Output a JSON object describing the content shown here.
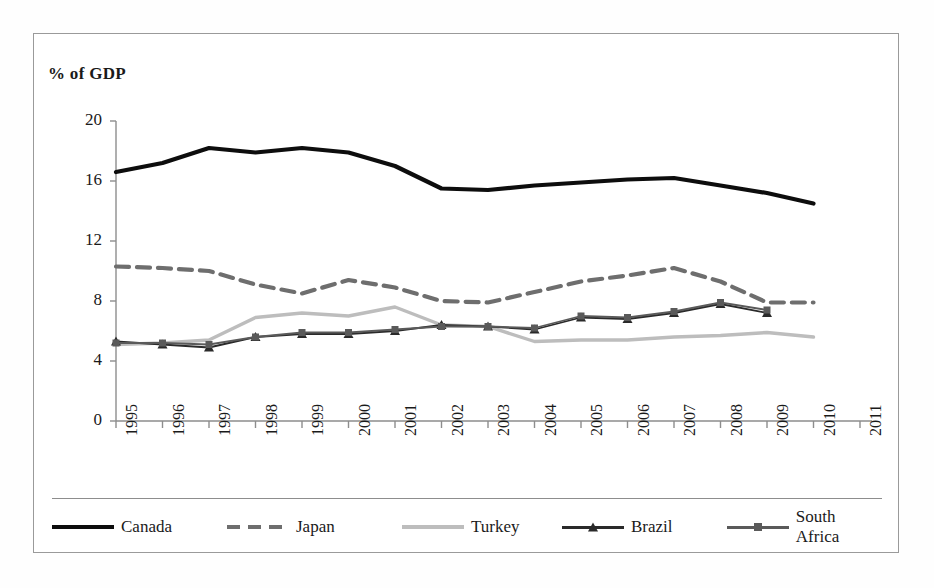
{
  "chart_data": {
    "type": "line",
    "title": "% of GDP",
    "xlabel": "",
    "ylabel": "% of GDP",
    "ylim": [
      0,
      20
    ],
    "yticks": [
      0,
      4,
      8,
      12,
      16,
      20
    ],
    "grid": false,
    "legend_position": "bottom",
    "categories": [
      "1995",
      "1996",
      "1997",
      "1998",
      "1999",
      "2000",
      "2001",
      "2002",
      "2003",
      "2004",
      "2005",
      "2006",
      "2007",
      "2008",
      "2009",
      "2010",
      "2011"
    ],
    "series": [
      {
        "name": "Canada",
        "style": "solid",
        "color": "#0d0d0d",
        "width": 4.2,
        "marker": "none",
        "values": [
          16.6,
          17.2,
          18.2,
          17.9,
          18.2,
          17.9,
          17.0,
          15.5,
          15.4,
          15.7,
          15.9,
          16.1,
          16.2,
          15.7,
          15.2,
          14.5,
          null
        ]
      },
      {
        "name": "Japan",
        "style": "dashed",
        "color": "#6e6e6e",
        "width": 4.2,
        "marker": "none",
        "values": [
          10.3,
          10.2,
          10.0,
          9.1,
          8.5,
          9.4,
          8.9,
          8.0,
          7.9,
          8.6,
          9.3,
          9.7,
          10.2,
          9.3,
          7.9,
          7.9,
          null
        ]
      },
      {
        "name": "Turkey",
        "style": "solid",
        "color": "#bdbdbd",
        "width": 3.4,
        "marker": "none",
        "values": [
          5.1,
          5.2,
          5.4,
          6.9,
          7.2,
          7.0,
          7.6,
          6.4,
          6.3,
          5.3,
          5.4,
          5.4,
          5.6,
          5.7,
          5.9,
          5.6,
          null
        ]
      },
      {
        "name": "Brazil",
        "style": "solid",
        "color": "#2a2a2a",
        "width": 1.8,
        "marker": "triangle",
        "values": [
          5.3,
          5.1,
          4.9,
          5.6,
          5.8,
          5.8,
          6.0,
          6.4,
          6.3,
          6.1,
          6.9,
          6.8,
          7.2,
          7.8,
          7.2,
          null,
          null
        ]
      },
      {
        "name": "South Africa",
        "style": "solid",
        "color": "#5a5a5a",
        "width": 1.8,
        "marker": "square",
        "values": [
          5.2,
          5.2,
          5.1,
          5.6,
          5.9,
          5.9,
          6.1,
          6.3,
          6.3,
          6.2,
          7.0,
          6.9,
          7.3,
          7.9,
          7.4,
          null,
          null
        ]
      }
    ]
  },
  "legend": {
    "items": [
      {
        "label": "Canada"
      },
      {
        "label": "Japan"
      },
      {
        "label": "Turkey"
      },
      {
        "label": "Brazil"
      },
      {
        "label": "South Africa"
      }
    ]
  }
}
